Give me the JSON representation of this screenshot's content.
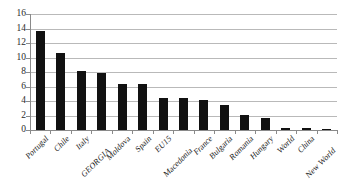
{
  "chart_data": {
    "type": "bar",
    "title": "",
    "subtitle": "",
    "xlabel": "",
    "ylabel": "",
    "ylim": [
      0,
      16
    ],
    "ytick_step": 2,
    "yticks": [
      16,
      14,
      12,
      10,
      8,
      6,
      4,
      2,
      0
    ],
    "grid": true,
    "legend": false,
    "bar_color": "#111111",
    "gridline_color": "#b9b9b9",
    "axis_color": "#8a8a8a",
    "categories": [
      "Portugal",
      "Chile",
      "Italy",
      "GEORGIA",
      "Moldova",
      "Spain",
      "EU15",
      "Macedonia",
      "France",
      "Bulgaria",
      "Romania",
      "Hungary",
      "World",
      "China",
      "New World"
    ],
    "values": [
      13.6,
      10.6,
      8.1,
      7.9,
      6.4,
      6.4,
      4.4,
      4.4,
      4.2,
      3.5,
      2.1,
      1.7,
      0.3,
      0.25,
      0.2
    ],
    "series": [
      {
        "name": "",
        "values": [
          13.6,
          10.6,
          8.1,
          7.9,
          6.4,
          6.4,
          4.4,
          4.4,
          4.2,
          3.5,
          2.1,
          1.7,
          0.3,
          0.25,
          0.2
        ]
      }
    ]
  }
}
